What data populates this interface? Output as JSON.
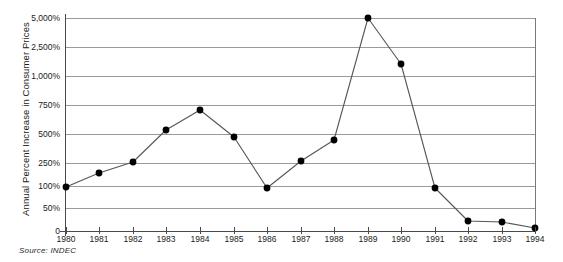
{
  "chart_data": {
    "type": "line",
    "title": "",
    "subtitle": "",
    "xlabel": "",
    "ylabel": "Annual Percent Increase in Consumer Prices",
    "source_note": "Source: INDEC",
    "grid": true,
    "legend": "none",
    "y_scale": "custom-compressed",
    "ylim": [
      0,
      5000
    ],
    "y_ticks": [
      {
        "value": 0,
        "label": "0",
        "y_px": 231
      },
      {
        "value": 50,
        "label": "50%",
        "y_px": 208
      },
      {
        "value": 100,
        "label": "100%",
        "y_px": 186
      },
      {
        "value": 250,
        "label": "250%",
        "y_px": 163
      },
      {
        "value": 500,
        "label": "500%",
        "y_px": 134
      },
      {
        "value": 750,
        "label": "750%",
        "y_px": 105
      },
      {
        "value": 1000,
        "label": "1,000%",
        "y_px": 76
      },
      {
        "value": 2500,
        "label": "2,500%",
        "y_px": 47
      },
      {
        "value": 5000,
        "label": "5,000%",
        "y_px": 18
      }
    ],
    "categories": [
      "1980",
      "1981",
      "1982",
      "1983",
      "1984",
      "1985",
      "1986",
      "1987",
      "1988",
      "1989",
      "1990",
      "1991",
      "1992",
      "1993",
      "1994"
    ],
    "x": [
      1980,
      1981,
      1982,
      1983,
      1984,
      1985,
      1986,
      1987,
      1988,
      1989,
      1990,
      1991,
      1992,
      1993,
      1994
    ],
    "values": [
      90,
      125,
      165,
      470,
      690,
      430,
      82,
      175,
      345,
      5000,
      1350,
      85,
      18,
      16,
      4
    ],
    "series": [
      {
        "name": "Annual Percent Increase in Consumer Prices",
        "values": [
          90,
          125,
          165,
          470,
          690,
          430,
          82,
          175,
          345,
          5000,
          1350,
          85,
          18,
          16,
          4
        ]
      }
    ],
    "point_pixels": [
      {
        "x": 1980,
        "px": 66,
        "py": 187
      },
      {
        "x": 1981,
        "px": 99,
        "py": 173
      },
      {
        "x": 1982,
        "px": 133,
        "py": 162
      },
      {
        "x": 1983,
        "px": 166,
        "py": 130
      },
      {
        "x": 1984,
        "px": 200,
        "py": 110
      },
      {
        "x": 1985,
        "px": 234,
        "py": 137
      },
      {
        "x": 1986,
        "px": 267,
        "py": 188
      },
      {
        "x": 1987,
        "px": 301,
        "py": 161
      },
      {
        "x": 1988,
        "px": 334,
        "py": 140
      },
      {
        "x": 1989,
        "px": 368,
        "py": 18
      },
      {
        "x": 1990,
        "px": 401,
        "py": 64
      },
      {
        "x": 1991,
        "px": 435,
        "py": 188
      },
      {
        "x": 1992,
        "px": 468,
        "py": 221
      },
      {
        "x": 1993,
        "px": 502,
        "py": 222
      },
      {
        "x": 1994,
        "px": 535,
        "py": 228
      }
    ],
    "colors": {
      "line": "#555555",
      "marker": "#000000",
      "gridline": "#9a9a9a",
      "axis": "#4a4a4a",
      "text": "#1a1a1a",
      "background": "#ffffff"
    }
  }
}
